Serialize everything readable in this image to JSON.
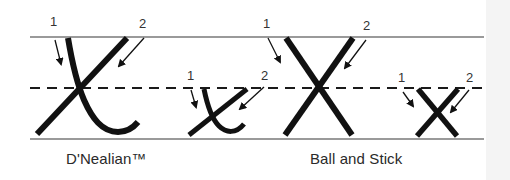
{
  "diagram": {
    "colors": {
      "guide_line": "#9a9a9a",
      "dashed_line": "#1a1a1a",
      "stroke": "#111111",
      "text": "#2a2a2a"
    },
    "sections": [
      {
        "label": "D'Nealian™",
        "letters": [
          {
            "char": "X",
            "case": "uppercase",
            "stroke_numbers": [
              "1",
              "2"
            ]
          },
          {
            "char": "x",
            "case": "lowercase",
            "stroke_numbers": [
              "1",
              "2"
            ]
          }
        ]
      },
      {
        "label": "Ball and Stick",
        "letters": [
          {
            "char": "X",
            "case": "uppercase",
            "stroke_numbers": [
              "1",
              "2"
            ]
          },
          {
            "char": "x",
            "case": "lowercase",
            "stroke_numbers": [
              "1",
              "2"
            ]
          }
        ]
      }
    ]
  }
}
